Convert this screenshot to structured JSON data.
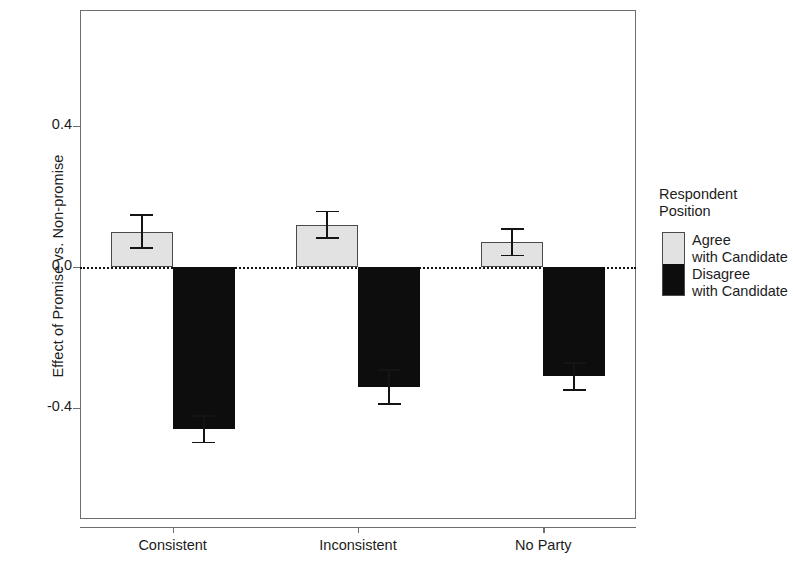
{
  "chart_data": {
    "type": "bar",
    "title": "",
    "xlabel": "",
    "ylabel": "Effect of Promise vs. Non-promise",
    "categories": [
      "Consistent",
      "Inconsistent",
      "No Party"
    ],
    "series": [
      {
        "name": "Agree\nwith Candidate",
        "color": "#e2e2e2",
        "values": [
          0.1,
          0.12,
          0.07
        ],
        "errors": [
          0.05,
          0.04,
          0.04
        ]
      },
      {
        "name": "Disagree\nwith Candidate",
        "color": "#0d0d0d",
        "values": [
          -0.46,
          -0.34,
          -0.31
        ],
        "errors": [
          0.04,
          0.05,
          0.04
        ]
      }
    ],
    "ylim": [
      -0.62,
      0.58
    ],
    "yticks": [
      0.4,
      0.0,
      -0.4
    ],
    "ytick_labels": [
      "0.4",
      "0.0",
      "-0.4"
    ],
    "grid": false,
    "zero_line": true,
    "zero_line_style": "dotted",
    "legend_position": "right",
    "legend_title": "Respondent\nPosition"
  },
  "axes": {
    "y_label": "Effect of Promise vs. Non-promise",
    "y_ticks": [
      {
        "label": "0.4",
        "value": 0.4
      },
      {
        "label": "0.0",
        "value": 0.0
      },
      {
        "label": "-0.4",
        "value": -0.4
      }
    ],
    "x_ticks": [
      {
        "label": "Consistent"
      },
      {
        "label": "Inconsistent"
      },
      {
        "label": "No Party"
      }
    ]
  },
  "legend": {
    "title": "Respondent\nPosition",
    "entries": [
      {
        "label": "Agree\nwith Candidate",
        "color": "#e2e2e2"
      },
      {
        "label": "Disagree\nwith Candidate",
        "color": "#0d0d0d"
      }
    ]
  }
}
